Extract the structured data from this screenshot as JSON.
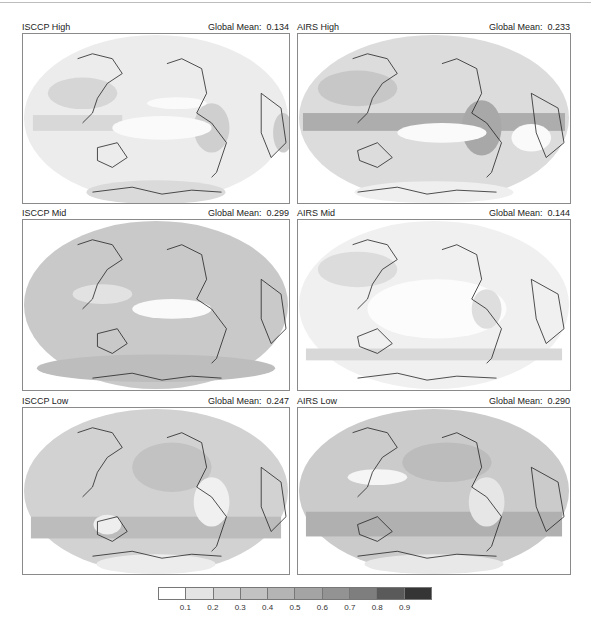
{
  "figure": {
    "panels": [
      {
        "id": "isccp-high",
        "title": "ISCCP High",
        "mean_label": "Global Mean:",
        "mean_value": "0.134"
      },
      {
        "id": "airs-high",
        "title": "AIRS High",
        "mean_label": "Global Mean:",
        "mean_value": "0.233"
      },
      {
        "id": "isccp-mid",
        "title": "ISCCP Mid",
        "mean_label": "Global Mean:",
        "mean_value": "0.299"
      },
      {
        "id": "airs-mid",
        "title": "AIRS Mid",
        "mean_label": "Global Mean:",
        "mean_value": "0.144"
      },
      {
        "id": "isccp-low",
        "title": "ISCCP Low",
        "mean_label": "Global Mean:",
        "mean_value": "0.247"
      },
      {
        "id": "airs-low",
        "title": "AIRS Low",
        "mean_label": "Global Mean:",
        "mean_value": "0.290"
      }
    ],
    "colorbar": {
      "ticks": [
        "0.1",
        "0.2",
        "0.3",
        "0.4",
        "0.5",
        "0.6",
        "0.7",
        "0.8",
        "0.9"
      ],
      "colors": [
        "#ffffff",
        "#e4e4e4",
        "#d2d2d2",
        "#c2c2c2",
        "#b4b4b4",
        "#a4a4a4",
        "#939393",
        "#7e7e7e",
        "#5a5a5a",
        "#353535"
      ]
    }
  },
  "chart_data": {
    "type": "heatmap",
    "projection": "Robinson-like, Pacific-centered",
    "panels": [
      {
        "name": "ISCCP High",
        "global_mean": 0.134
      },
      {
        "name": "AIRS High",
        "global_mean": 0.233
      },
      {
        "name": "ISCCP Mid",
        "global_mean": 0.299
      },
      {
        "name": "AIRS Mid",
        "global_mean": 0.144
      },
      {
        "name": "ISCCP Low",
        "global_mean": 0.247
      },
      {
        "name": "AIRS Low",
        "global_mean": 0.29
      }
    ],
    "colorbar": {
      "min": 0.0,
      "max": 1.0,
      "step": 0.1,
      "tick_labels": [
        "0.1",
        "0.2",
        "0.3",
        "0.4",
        "0.5",
        "0.6",
        "0.7",
        "0.8",
        "0.9"
      ],
      "colormap": "grayscale, white (low) to dark gray (high)"
    },
    "legend_position": "bottom"
  }
}
